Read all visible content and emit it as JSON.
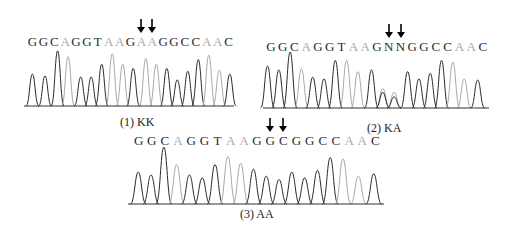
{
  "figure": {
    "panels": [
      {
        "id": 1,
        "caption": "(1) KK",
        "sequence": [
          "G",
          "G",
          "C",
          "A",
          "G",
          "G",
          "T",
          "A",
          "A",
          "G",
          "A",
          "A",
          "G",
          "G",
          "C",
          "C",
          "A",
          "A",
          "C"
        ],
        "light_bases": [
          3,
          7,
          8,
          10,
          11,
          16,
          17
        ],
        "arrow_positions": [
          10,
          11
        ],
        "peaks": [
          {
            "x": 0.04,
            "h": 0.55,
            "c": "d"
          },
          {
            "x": 0.1,
            "h": 0.52,
            "c": "d"
          },
          {
            "x": 0.16,
            "h": 0.95,
            "c": "d"
          },
          {
            "x": 0.21,
            "h": 0.85,
            "c": "l"
          },
          {
            "x": 0.27,
            "h": 0.5,
            "c": "d"
          },
          {
            "x": 0.32,
            "h": 0.5,
            "c": "d"
          },
          {
            "x": 0.37,
            "h": 0.72,
            "c": "d"
          },
          {
            "x": 0.42,
            "h": 0.9,
            "c": "l"
          },
          {
            "x": 0.47,
            "h": 0.72,
            "c": "l"
          },
          {
            "x": 0.52,
            "h": 0.65,
            "c": "d"
          },
          {
            "x": 0.58,
            "h": 0.82,
            "c": "l"
          },
          {
            "x": 0.63,
            "h": 0.72,
            "c": "l"
          },
          {
            "x": 0.68,
            "h": 0.65,
            "c": "d"
          },
          {
            "x": 0.73,
            "h": 0.45,
            "c": "d"
          },
          {
            "x": 0.78,
            "h": 0.6,
            "c": "d"
          },
          {
            "x": 0.83,
            "h": 0.8,
            "c": "d"
          },
          {
            "x": 0.88,
            "h": 0.88,
            "c": "l"
          },
          {
            "x": 0.93,
            "h": 0.62,
            "c": "l"
          },
          {
            "x": 0.98,
            "h": 0.55,
            "c": "d"
          }
        ]
      },
      {
        "id": 2,
        "caption": "(2) KA",
        "sequence": [
          "G",
          "G",
          "C",
          "A",
          "G",
          "G",
          "T",
          "A",
          "A",
          "G",
          "N",
          "N",
          "G",
          "G",
          "C",
          "C",
          "A",
          "A",
          "C"
        ],
        "light_bases": [
          3,
          7,
          8,
          16,
          17
        ],
        "arrow_positions": [
          10,
          11
        ],
        "peaks": [
          {
            "x": 0.02,
            "h": 0.75,
            "c": "d"
          },
          {
            "x": 0.07,
            "h": 0.68,
            "c": "d"
          },
          {
            "x": 0.12,
            "h": 1.0,
            "c": "d"
          },
          {
            "x": 0.17,
            "h": 0.7,
            "c": "l"
          },
          {
            "x": 0.22,
            "h": 0.55,
            "c": "d"
          },
          {
            "x": 0.27,
            "h": 0.52,
            "c": "d"
          },
          {
            "x": 0.32,
            "h": 0.85,
            "c": "d"
          },
          {
            "x": 0.37,
            "h": 0.85,
            "c": "l"
          },
          {
            "x": 0.42,
            "h": 0.65,
            "c": "l"
          },
          {
            "x": 0.48,
            "h": 0.68,
            "c": "d"
          },
          {
            "x": 0.53,
            "h": 0.35,
            "c": "l"
          },
          {
            "x": 0.53,
            "h": 0.28,
            "c": "d"
          },
          {
            "x": 0.58,
            "h": 0.28,
            "c": "l"
          },
          {
            "x": 0.58,
            "h": 0.2,
            "c": "d"
          },
          {
            "x": 0.64,
            "h": 0.65,
            "c": "d"
          },
          {
            "x": 0.69,
            "h": 0.52,
            "c": "d"
          },
          {
            "x": 0.74,
            "h": 0.62,
            "c": "d"
          },
          {
            "x": 0.79,
            "h": 0.85,
            "c": "d"
          },
          {
            "x": 0.84,
            "h": 0.82,
            "c": "l"
          },
          {
            "x": 0.89,
            "h": 0.52,
            "c": "l"
          },
          {
            "x": 0.95,
            "h": 0.5,
            "c": "d"
          }
        ]
      },
      {
        "id": 3,
        "caption": "(3) AA",
        "sequence": [
          "G",
          "G",
          "C",
          "A",
          "G",
          "G",
          "T",
          "A",
          "A",
          "G",
          "G",
          "C",
          "G",
          "G",
          "C",
          "C",
          "A",
          "A",
          "C"
        ],
        "light_bases": [
          3,
          7,
          8,
          16,
          17
        ],
        "arrow_positions": [
          10,
          11
        ],
        "peaks": [
          {
            "x": 0.04,
            "h": 0.55,
            "c": "d"
          },
          {
            "x": 0.09,
            "h": 0.5,
            "c": "d"
          },
          {
            "x": 0.14,
            "h": 0.98,
            "c": "d"
          },
          {
            "x": 0.19,
            "h": 0.68,
            "c": "l"
          },
          {
            "x": 0.24,
            "h": 0.5,
            "c": "d"
          },
          {
            "x": 0.29,
            "h": 0.45,
            "c": "d"
          },
          {
            "x": 0.34,
            "h": 0.68,
            "c": "d"
          },
          {
            "x": 0.39,
            "h": 0.82,
            "c": "l"
          },
          {
            "x": 0.44,
            "h": 0.7,
            "c": "l"
          },
          {
            "x": 0.49,
            "h": 0.6,
            "c": "d"
          },
          {
            "x": 0.54,
            "h": 0.48,
            "c": "d"
          },
          {
            "x": 0.59,
            "h": 0.42,
            "c": "d"
          },
          {
            "x": 0.64,
            "h": 0.55,
            "c": "d"
          },
          {
            "x": 0.69,
            "h": 0.45,
            "c": "d"
          },
          {
            "x": 0.74,
            "h": 0.58,
            "c": "d"
          },
          {
            "x": 0.79,
            "h": 0.8,
            "c": "d"
          },
          {
            "x": 0.84,
            "h": 0.78,
            "c": "l"
          },
          {
            "x": 0.9,
            "h": 0.48,
            "c": "l"
          },
          {
            "x": 0.96,
            "h": 0.52,
            "c": "d"
          }
        ]
      }
    ],
    "colors": {
      "dark_trace": "#2a2a2a",
      "light_trace": "#a8a8a8",
      "baseline": "#333333"
    }
  }
}
